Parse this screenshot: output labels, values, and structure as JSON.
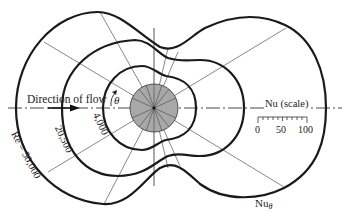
{
  "figure": {
    "flow_label": "Direction of flow",
    "angle_label": "θ",
    "curve_labels": [
      {
        "id": "re-50000",
        "text": "Re = 50,000"
      },
      {
        "id": "re-20500",
        "text": "20,500"
      },
      {
        "id": "re-4000",
        "text": "4,000"
      }
    ],
    "scale": {
      "title": "Nu (scale)",
      "ticks": [
        "0",
        "50",
        "100"
      ]
    },
    "nu_theta_label": "Nu",
    "nu_theta_sub": "θ"
  },
  "colors": {
    "curve": "#1a1a1a",
    "cylinder_fill": "#a8a8a8",
    "background": "#ffffff"
  }
}
